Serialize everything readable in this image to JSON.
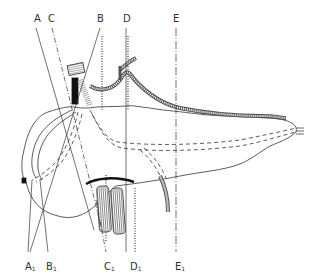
{
  "figure": {
    "type": "anatomical line drawing",
    "stroke_color": "#333333",
    "background": "#ffffff"
  },
  "labels": {
    "top": [
      {
        "id": "A",
        "text": "A",
        "x": 34,
        "y": 14
      },
      {
        "id": "C",
        "text": "C",
        "x": 48,
        "y": 14
      },
      {
        "id": "B",
        "text": "B",
        "x": 97,
        "y": 14
      },
      {
        "id": "D",
        "text": "D",
        "x": 123,
        "y": 14
      },
      {
        "id": "E",
        "text": "E",
        "x": 173,
        "y": 14
      }
    ],
    "bottom": [
      {
        "id": "A1",
        "text": "A",
        "sub": "1",
        "x": 25,
        "y": 262
      },
      {
        "id": "B1",
        "text": "B",
        "sub": "1",
        "x": 46,
        "y": 262
      },
      {
        "id": "C1",
        "text": "C",
        "sub": "1",
        "x": 104,
        "y": 262
      },
      {
        "id": "D1",
        "text": "D",
        "sub": "1",
        "x": 130,
        "y": 262
      },
      {
        "id": "E1",
        "text": "E",
        "sub": "1",
        "x": 175,
        "y": 262
      }
    ]
  }
}
